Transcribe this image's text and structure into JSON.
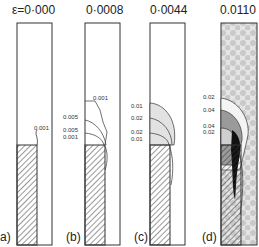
{
  "figure": {
    "panels": [
      {
        "id": "a",
        "label": "a)",
        "strain_title": "ε=0·000",
        "contour_labels": [
          "0.001"
        ]
      },
      {
        "id": "b",
        "label": "(b)",
        "strain_title": "0·0008",
        "contour_labels": [
          "0.001",
          "0.005",
          "0.005",
          "0.001"
        ]
      },
      {
        "id": "c",
        "label": "(c)",
        "strain_title": "0·0044",
        "contour_labels": [
          "0.01",
          "0.02",
          "0.02",
          "0.01"
        ]
      },
      {
        "id": "d",
        "label": "(d)",
        "strain_title": "0.0110",
        "contour_labels": [
          "0.02",
          "0.04",
          "0.04",
          "0.02"
        ]
      }
    ]
  }
}
